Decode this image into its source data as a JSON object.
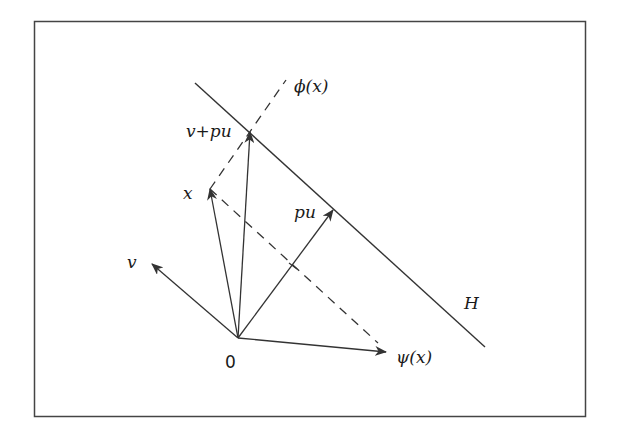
{
  "diagram": {
    "frame": {
      "x": 34,
      "y": 21,
      "width": 551,
      "height": 395,
      "stroke": "#444444"
    },
    "colors": {
      "line": "#333333",
      "text": "#1a1a1a",
      "background": "#ffffff"
    },
    "origin": {
      "x": 238,
      "y": 338,
      "label": "0"
    },
    "vectors": [
      {
        "id": "x",
        "label": "x",
        "to": [
          210,
          189
        ],
        "label_pos": [
          182,
          198
        ]
      },
      {
        "id": "v",
        "label": "v",
        "to": [
          152,
          264
        ],
        "label_pos": [
          127,
          266
        ]
      },
      {
        "id": "v_plus_pu",
        "label": "v+pu",
        "to": [
          250,
          132
        ],
        "label_pos": [
          187,
          136
        ]
      },
      {
        "id": "pu",
        "label": "pu",
        "to": [
          333,
          210
        ],
        "label_pos": [
          294,
          217
        ]
      },
      {
        "id": "psi_x",
        "label": "ψ(x)",
        "to": [
          386,
          352
        ],
        "label_pos": [
          396,
          362
        ]
      }
    ],
    "hyperplane": {
      "label": "H",
      "from": [
        195,
        83
      ],
      "to": [
        485,
        347
      ],
      "label_pos": [
        464,
        307
      ]
    },
    "dashed_lines": [
      {
        "id": "phi_x_line",
        "from": [
          210,
          189
        ],
        "to": [
          286,
          80
        ],
        "label": "ϕ(x)",
        "label_pos": [
          296,
          91
        ]
      },
      {
        "id": "x_to_psi",
        "from": [
          210,
          189
        ],
        "to": [
          378,
          343
        ]
      }
    ],
    "tick_mark": {
      "on": "pu",
      "at": [
        293,
        266
      ]
    }
  }
}
